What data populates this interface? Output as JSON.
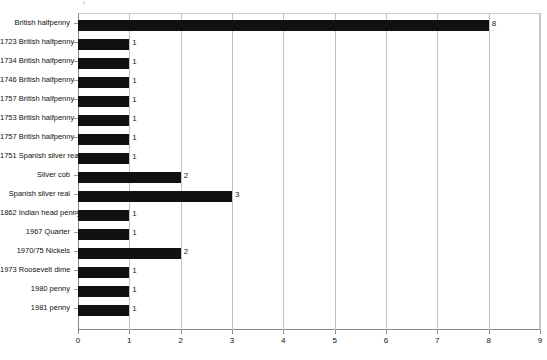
{
  "chart_data": {
    "type": "bar",
    "orientation": "horizontal",
    "title": "",
    "subtitle": "",
    "xlabel": "",
    "ylabel": "",
    "xlim": [
      0,
      9
    ],
    "ylim": null,
    "grid": true,
    "legend": null,
    "xticks": [
      "0",
      "1",
      "2",
      "3",
      "4",
      "5",
      "6",
      "7",
      "8",
      "9"
    ],
    "categories": [
      "British halfpenny",
      "1723 British halfpenny",
      "1734 British halfpenny",
      "1746 British halfpenny",
      "1757 British halfpenny",
      "1753 British halfpenny",
      "1757 British halfpenny",
      "1751 Spanish silver real",
      "Silver cob",
      "Spanish silver real",
      "1862 Indian head penny",
      "1967 Quarter",
      "1970/75 Nickels",
      "1973 Roosevelt dime",
      "1980 penny",
      "1981 penny"
    ],
    "values": [
      8,
      1,
      1,
      1,
      1,
      1,
      1,
      1,
      2,
      3,
      1,
      1,
      2,
      1,
      1,
      1
    ],
    "value_labels": [
      "8",
      "1",
      "1",
      "1",
      "1",
      "1",
      "1",
      "1",
      "2",
      "3",
      "1",
      "1",
      "2",
      "1",
      "1",
      "1"
    ],
    "bar_color": "#111111",
    "grid_color": "#c2c2c2",
    "axis_color": "#8a8a8a",
    "background": "#ffffff"
  },
  "artifact": {
    "top_mark": "4"
  }
}
